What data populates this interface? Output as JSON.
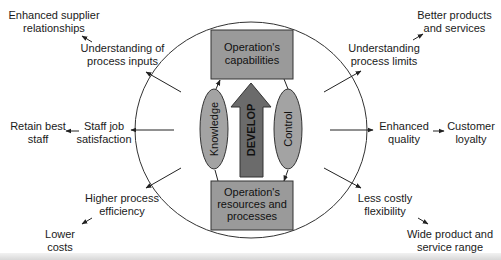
{
  "diagram": {
    "center": {
      "top_box": {
        "line1": "Operation's",
        "line2": "capabilities"
      },
      "bottom_box": {
        "line1": "Operation's",
        "line2": "resources and",
        "line3": "processes"
      },
      "develop_arrow": "DEVELOP",
      "left_ellipse": "Knowledge",
      "right_ellipse": "Control"
    },
    "outcomes": {
      "upper_left": {
        "inner": {
          "line1": "Understanding of",
          "line2": "process inputs"
        },
        "outer": {
          "line1": "Enhanced supplier",
          "line2": "relationships"
        }
      },
      "left": {
        "inner": {
          "line1": "Staff job",
          "line2": "satisfaction"
        },
        "outer": {
          "line1": "Retain best",
          "line2": "staff"
        }
      },
      "lower_left": {
        "inner": {
          "line1": "Higher process",
          "line2": "efficiency"
        },
        "outer": {
          "line1": "Lower",
          "line2": "costs"
        }
      },
      "upper_right": {
        "inner": {
          "line1": "Understanding",
          "line2": "process limits"
        },
        "outer": {
          "line1": "Better products",
          "line2": "and services"
        }
      },
      "right": {
        "inner": {
          "line1": "Enhanced",
          "line2": "quality"
        },
        "outer": {
          "line1": "Customer",
          "line2": "loyalty"
        }
      },
      "lower_right": {
        "inner": {
          "line1": "Less costly",
          "line2": "flexibility"
        },
        "outer": {
          "line1": "Wide product and",
          "line2": "service range"
        }
      }
    },
    "colors": {
      "box_fill": "#9a9a9a",
      "ellipse_fill": "#a3a3a3",
      "arrow_fill": "#6b6b6b",
      "line": "#222222",
      "background": "#ffffff"
    }
  }
}
